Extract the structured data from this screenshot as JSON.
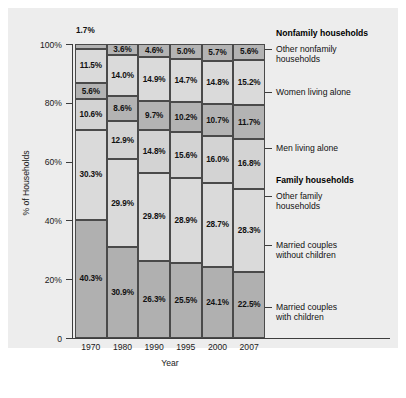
{
  "chart_data": {
    "type": "bar",
    "subtype": "stacked-100-percent",
    "title": "",
    "xlabel": "Year",
    "ylabel": "% of Households",
    "categories": [
      "1970",
      "1980",
      "1990",
      "1995",
      "2000",
      "2007"
    ],
    "ylim": [
      0,
      100
    ],
    "ytick_labels": [
      "100%",
      "80%",
      "60%",
      "40%",
      "20%",
      "0"
    ],
    "ytick_values": [
      100,
      80,
      60,
      40,
      20,
      0
    ],
    "grid": false,
    "legend_position": "right",
    "stack_order": "bottom-to-top",
    "series": [
      {
        "name": "Married couples with children",
        "group": "Family households",
        "color": "#b0b0b0",
        "values": [
          40.3,
          30.9,
          26.3,
          25.5,
          24.1,
          22.5
        ],
        "labels": [
          "40.3%",
          "30.9%",
          "26.3%",
          "25.5%",
          "24.1%",
          "22.5%"
        ]
      },
      {
        "name": "Married couples without children",
        "group": "Family households",
        "color": "#dadada",
        "values": [
          30.3,
          29.9,
          29.8,
          28.9,
          28.7,
          28.3
        ],
        "labels": [
          "30.3%",
          "29.9%",
          "29.8%",
          "28.9%",
          "28.7%",
          "28.3%"
        ]
      },
      {
        "name": "Other family households",
        "group": "Family households",
        "color": "#d3d3d3",
        "values": [
          10.6,
          12.9,
          14.8,
          15.6,
          16.0,
          16.8
        ],
        "labels": [
          "10.6%",
          "12.9%",
          "14.8%",
          "15.6%",
          "16.0%",
          "16.8%"
        ]
      },
      {
        "name": "Men living alone",
        "group": "Nonfamily households",
        "color": "#b3b3b3",
        "values": [
          5.6,
          8.6,
          9.7,
          10.2,
          10.7,
          11.7
        ],
        "labels": [
          "5.6%",
          "8.6%",
          "9.7%",
          "10.2%",
          "10.7%",
          "11.7%"
        ]
      },
      {
        "name": "Women living alone",
        "group": "Nonfamily households",
        "color": "#dadada",
        "values": [
          11.5,
          14.0,
          14.9,
          14.7,
          14.8,
          15.2
        ],
        "labels": [
          "11.5%",
          "14.0%",
          "14.9%",
          "14.7%",
          "14.8%",
          "15.2%"
        ]
      },
      {
        "name": "Other nonfamily households",
        "group": "Nonfamily households",
        "color": "#b3b3b3",
        "values": [
          1.7,
          3.6,
          4.6,
          5.0,
          5.7,
          5.6
        ],
        "labels": [
          "1.7%",
          "3.6%",
          "4.6%",
          "5.0%",
          "5.7%",
          "5.6%"
        ]
      }
    ],
    "annotations": [
      {
        "text": "1.7%",
        "for_category": "1970",
        "for_series": "Other nonfamily households",
        "placement": "above-bar"
      }
    ]
  },
  "axes": {
    "y_title": "% of Households",
    "x_title": "Year",
    "y_ticks": [
      {
        "label": "100%",
        "value": 100
      },
      {
        "label": "80%",
        "value": 80
      },
      {
        "label": "60%",
        "value": 60
      },
      {
        "label": "40%",
        "value": 40
      },
      {
        "label": "20%",
        "value": 20
      },
      {
        "label": "0",
        "value": 0
      }
    ],
    "x_ticks": [
      "1970",
      "1980",
      "1990",
      "1995",
      "2000",
      "2007"
    ]
  },
  "legend": {
    "headings": [
      {
        "label": "Nonfamily households"
      },
      {
        "label": "Family households"
      }
    ],
    "entries": [
      {
        "label": "Other nonfamily\nhouseholds"
      },
      {
        "label": "Women living alone"
      },
      {
        "label": "Men living alone"
      },
      {
        "label": "Other family\nhouseholds"
      },
      {
        "label": "Married couples\nwithout children"
      },
      {
        "label": "Married couples\nwith children"
      }
    ]
  },
  "callout": {
    "top_1970": "1.7%"
  },
  "colors": {
    "panel_background": "#ededed",
    "page_background": "#ffffff",
    "axis": "#3d3d3d",
    "segment_border": "#4a4a4a",
    "dark_gray": "#b3b3b3",
    "light_gray": "#dadada",
    "mid_gray": "#d3d3d3",
    "base_gray": "#b0b0b0",
    "text": "#111111"
  }
}
